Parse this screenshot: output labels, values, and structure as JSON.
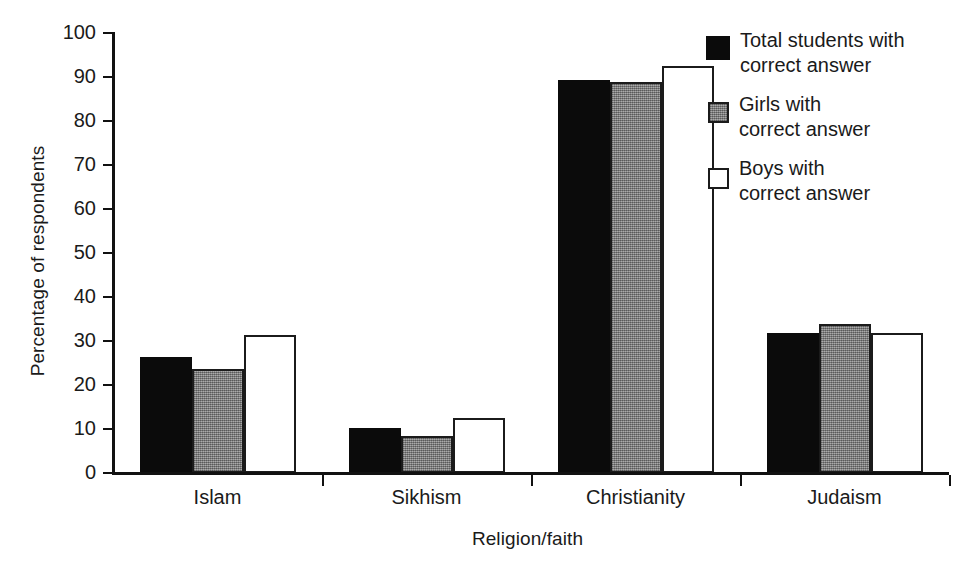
{
  "chart_data": {
    "type": "bar",
    "title": "",
    "xlabel": "Religion/faith",
    "ylabel": "Percentage of respondents",
    "categories": [
      "Islam",
      "Sikhism",
      "Christianity",
      "Judaism"
    ],
    "series": [
      {
        "name": "Total students with correct answer",
        "values": [
          26.3,
          10.2,
          89.3,
          31.8
        ],
        "color": "#0b0b0b",
        "style": "solid-black"
      },
      {
        "name": "Girls with correct answer",
        "values": [
          23.6,
          8.4,
          88.8,
          33.8
        ],
        "color": "#8c8c8c",
        "style": "gray-stippled"
      },
      {
        "name": "Boys with correct answer",
        "values": [
          31.3,
          12.5,
          92.6,
          31.8
        ],
        "color": "#ffffff",
        "style": "white-outlined"
      }
    ],
    "ylim": [
      0,
      100
    ],
    "ytick_values": [
      0,
      10,
      20,
      30,
      40,
      50,
      60,
      70,
      80,
      90,
      100
    ],
    "ytick_labels": [
      "0",
      "10",
      "20",
      "30",
      "40",
      "50",
      "60",
      "70",
      "80",
      "90",
      "100"
    ],
    "grid": false,
    "legend_position": "top-right"
  },
  "legend": {
    "items": [
      {
        "label_line1": "Total students with",
        "label_line2": "correct answer",
        "swatch": "black-filled-square-icon"
      },
      {
        "label_line1": "Girls with",
        "label_line2": "correct answer",
        "swatch": "gray-filled-square-icon"
      },
      {
        "label_line1": "Boys with",
        "label_line2": "correct answer",
        "swatch": "white-outlined-square-icon"
      }
    ]
  }
}
